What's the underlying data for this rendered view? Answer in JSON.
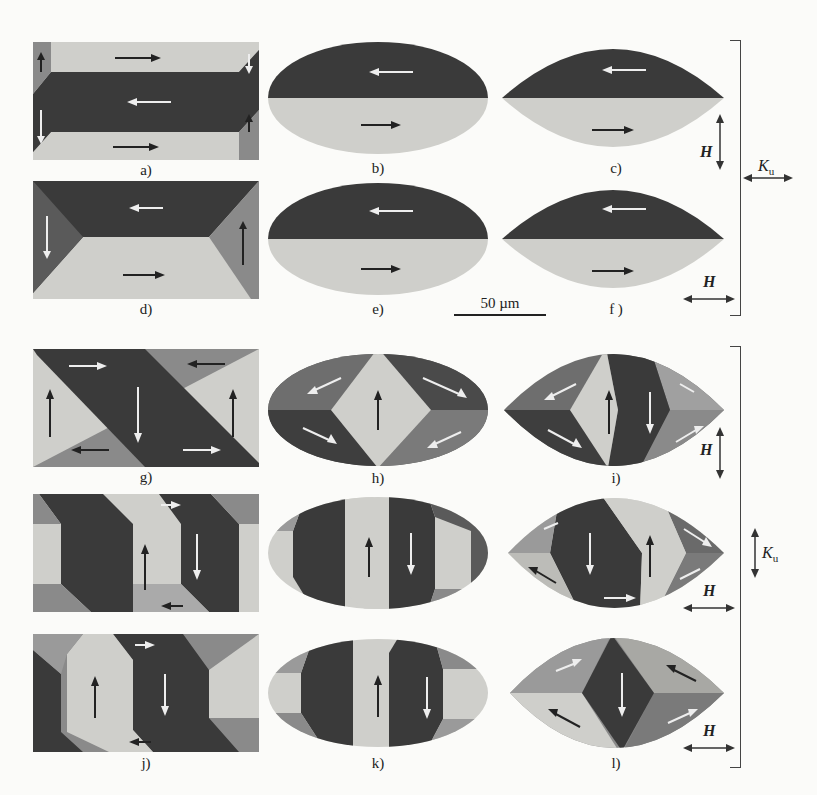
{
  "figure": {
    "header_fragment": "… g …",
    "scale_bar": {
      "label": "50 µm"
    },
    "colors": {
      "dark": "#3a3a3a",
      "mid": "#8a8a8a",
      "light": "#cfcfcb",
      "ink": "#222222",
      "paper": "#fbfbf9"
    },
    "panels": [
      {
        "id": "a",
        "label": "a)",
        "shape": "rectangle",
        "row": 1,
        "col": 1
      },
      {
        "id": "b",
        "label": "b)",
        "shape": "ellipse",
        "row": 1,
        "col": 2
      },
      {
        "id": "c",
        "label": "c)",
        "shape": "lens",
        "row": 1,
        "col": 3
      },
      {
        "id": "d",
        "label": "d)",
        "shape": "rectangle",
        "row": 2,
        "col": 1
      },
      {
        "id": "e",
        "label": "e)",
        "shape": "ellipse",
        "row": 2,
        "col": 2
      },
      {
        "id": "f",
        "label": "f )",
        "shape": "lens",
        "row": 2,
        "col": 3
      },
      {
        "id": "g",
        "label": "g)",
        "shape": "rectangle",
        "row": 3,
        "col": 1
      },
      {
        "id": "h",
        "label": "h)",
        "shape": "ellipse",
        "row": 3,
        "col": 2
      },
      {
        "id": "i",
        "label": "i)",
        "shape": "lens",
        "row": 3,
        "col": 3
      },
      {
        "id": "j",
        "label": "j)",
        "shape": "rectangle",
        "row": 5,
        "col": 1
      },
      {
        "id": "k",
        "label": "k)",
        "shape": "ellipse",
        "row": 5,
        "col": 2
      },
      {
        "id": "l",
        "label": "l)",
        "shape": "lens",
        "row": 5,
        "col": 3
      }
    ],
    "top_group": {
      "field_labels": [
        "H",
        "H"
      ],
      "field_directions": [
        "vertical",
        "horizontal"
      ],
      "anisotropy_label": "K",
      "anisotropy_subscript": "u",
      "anisotropy_direction": "horizontal"
    },
    "bottom_group": {
      "field_labels": [
        "H",
        "H",
        "H"
      ],
      "field_directions": [
        "vertical",
        "horizontal",
        "horizontal"
      ],
      "anisotropy_label": "K",
      "anisotropy_subscript": "u",
      "anisotropy_direction": "vertical"
    }
  }
}
